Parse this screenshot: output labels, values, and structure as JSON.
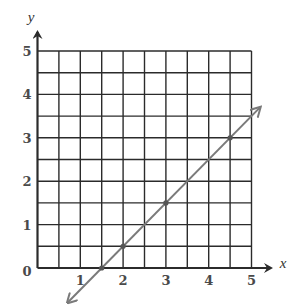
{
  "chart_data": {
    "type": "line",
    "title": "",
    "xlabel": "x",
    "ylabel": "y",
    "xlim": [
      0,
      5
    ],
    "ylim": [
      0,
      5
    ],
    "grid": true,
    "grid_step": 0.5,
    "x_ticks": [
      "1",
      "2",
      "3",
      "4",
      "5"
    ],
    "y_ticks": [
      "1",
      "2",
      "3",
      "4",
      "5"
    ],
    "origin_label": "0",
    "series": [
      {
        "name": "line",
        "equation": "y = x - 1.5",
        "arrows_both_ends": true,
        "extent": {
          "from": [
            0.7,
            -0.8
          ],
          "to": [
            5.2,
            3.7
          ]
        },
        "marked_points": [
          [
            1.5,
            0
          ],
          [
            2,
            0.5
          ],
          [
            3,
            1.5
          ],
          [
            4.5,
            3
          ]
        ]
      }
    ]
  },
  "colors": {
    "grid": "#2b2b2b",
    "axis": "#2b2b2b",
    "line": "#7a7a7a",
    "label": "#4a4a4a"
  }
}
